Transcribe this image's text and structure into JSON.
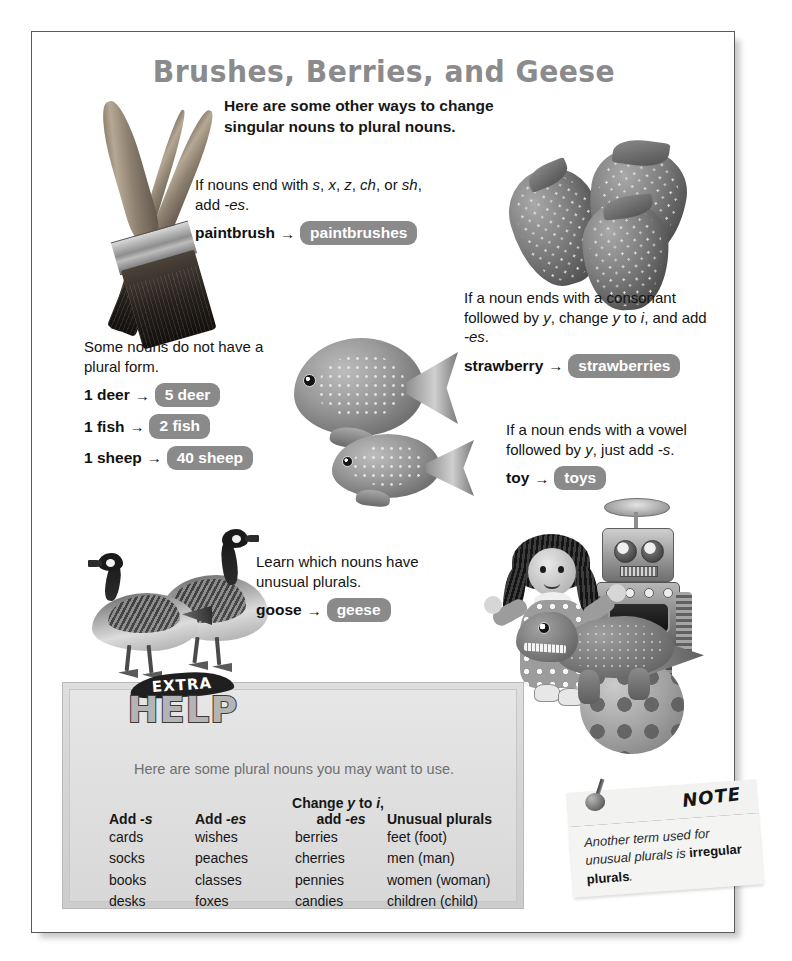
{
  "page": {
    "title": "Brushes, Berries, and Geese",
    "subtitle": "Here are some other ways to change singular nouns to plural nouns."
  },
  "rules": [
    {
      "id": "es",
      "text_html": "If nouns end with <i>s</i>, <i>x</i>, <i>z</i>, <i>ch</i>, or <i>sh</i>, add <i>-es</i>.",
      "text_plain": "If nouns end with s, x, z, ch, or sh, add -es.",
      "pairs": [
        {
          "singular": "paintbrush",
          "arrow": "→",
          "plural": "paintbrushes"
        }
      ]
    },
    {
      "id": "no-plural",
      "text_html": "Some nouns do not have a plural form.",
      "text_plain": "Some nouns do not have a plural form.",
      "pairs": [
        {
          "singular": "1 deer",
          "arrow": "→",
          "plural": "5 deer"
        },
        {
          "singular": "1 fish",
          "arrow": "→",
          "plural": "2 fish"
        },
        {
          "singular": "1 sheep",
          "arrow": "→",
          "plural": "40 sheep"
        }
      ]
    },
    {
      "id": "consonant-y",
      "text_html": "If a noun ends with a consonant followed by <i>y</i>, change <i>y</i> to <i>i</i>, and add <i>-es</i>.",
      "text_plain": "If a noun ends with a consonant followed by y, change y to i, and add -es.",
      "pairs": [
        {
          "singular": "strawberry",
          "arrow": "→",
          "plural": "strawberries"
        }
      ]
    },
    {
      "id": "vowel-y",
      "text_html": "If a noun ends with a vowel followed by <i>y</i>, just add <i>-s</i>.",
      "text_plain": "If a noun ends with a vowel followed by y, just add -s.",
      "pairs": [
        {
          "singular": "toy",
          "arrow": "→",
          "plural": "toys"
        }
      ]
    },
    {
      "id": "unusual",
      "text_html": "Learn which nouns have unusual plurals.",
      "text_plain": "Learn which nouns have unusual plurals.",
      "pairs": [
        {
          "singular": "goose",
          "arrow": "→",
          "plural": "geese"
        }
      ]
    }
  ],
  "extra_help": {
    "badge_top": "EXTRA",
    "badge_main": "HELP",
    "lead": "Here are some plural nouns you may want to use.",
    "columns": [
      {
        "head_top": "",
        "head_html": "Add <i>-s</i>",
        "head_plain": "Add -s",
        "cells": [
          "cards",
          "socks",
          "books",
          "desks"
        ]
      },
      {
        "head_top": "",
        "head_html": "Add <i>-es</i>",
        "head_plain": "Add -es",
        "cells": [
          "wishes",
          "peaches",
          "classes",
          "foxes"
        ]
      },
      {
        "head_top_html": "Change <i>y</i> to <i>i</i>,",
        "head_top_plain": "Change y to i,",
        "head_html": "add <i>-es</i>",
        "head_plain": "add -es",
        "cells": [
          "berries",
          "cherries",
          "pennies",
          "candies"
        ]
      },
      {
        "head_top": "",
        "head_html": "Unusual plurals",
        "head_plain": "Unusual plurals",
        "cells": [
          "feet (foot)",
          "men (man)",
          "women (woman)",
          "children (child)"
        ]
      }
    ]
  },
  "note": {
    "label": "NOTE",
    "body_html": "Another term used for unusual plurals is <b>irregular plurals</b>.",
    "body_plain": "Another term used for unusual plurals is irregular plurals."
  },
  "illustrations": [
    {
      "name": "paintbrushes-illustration",
      "alt": "three crossed paintbrushes"
    },
    {
      "name": "strawberries-illustration",
      "alt": "three strawberries"
    },
    {
      "name": "fish-illustration",
      "alt": "two tropical fish"
    },
    {
      "name": "geese-illustration",
      "alt": "two Canada geese"
    },
    {
      "name": "toys-illustration",
      "alt": "doll, robot, dinosaur and polka dot ball"
    }
  ],
  "colors": {
    "pill_background": "#8a8a8a",
    "pill_text": "#ffffff",
    "title": "#8b8b8d",
    "help_box": "#d6d6d6",
    "note_paper": "#f4f4f2",
    "page_border": "#59595b"
  }
}
